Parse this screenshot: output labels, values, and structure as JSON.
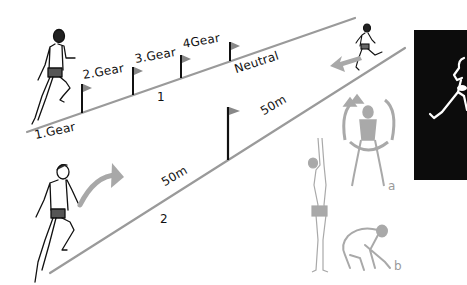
{
  "illustration": {
    "track_1": {
      "number_label": "1",
      "gear_labels": [
        "1.Gear",
        "2.Gear",
        "3.Gear",
        "4Gear"
      ],
      "neutral_label": "Neutral"
    },
    "track_2": {
      "number_label": "2",
      "distance_labels": [
        "50m",
        "50m"
      ]
    },
    "exercise_labels": {
      "a": "a",
      "b": "b"
    },
    "colors": {
      "ink": "#111111",
      "track_line": "#9a9a9a",
      "arrow": "#a8a8a8",
      "exercise_figures": "#a9a9a9",
      "photo_background": "#0c0c0c"
    }
  }
}
